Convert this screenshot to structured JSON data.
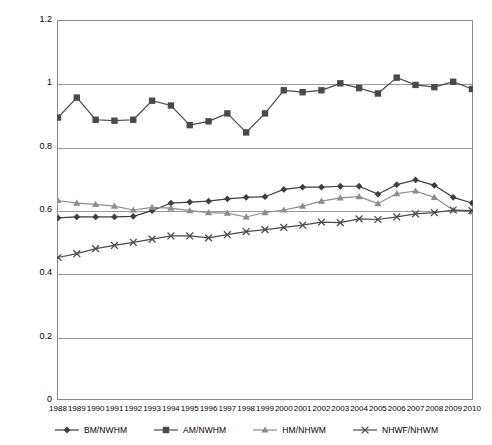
{
  "chart_data": {
    "type": "line",
    "title": "",
    "xlabel": "",
    "ylabel": "",
    "ylim": [
      0,
      1.2
    ],
    "yticks": [
      "0",
      "0.2",
      "0.4",
      "0.6",
      "0.8",
      "1",
      "1.2"
    ],
    "ytick_values": [
      0,
      0.2,
      0.4,
      0.6,
      0.8,
      1.0,
      1.2
    ],
    "grid": true,
    "legend_position": "bottom",
    "categories": [
      "1988",
      "1989",
      "1990",
      "1991",
      "1992",
      "1993",
      "1994",
      "1995",
      "1996",
      "1997",
      "1998",
      "1999",
      "2000",
      "2001",
      "2002",
      "2003",
      "2004",
      "2005",
      "2006",
      "2007",
      "2008",
      "2009",
      "2010"
    ],
    "series": [
      {
        "name": "BM/NWHM",
        "marker": "diamond",
        "color": "#3f3f3f",
        "values": [
          0.575,
          0.578,
          0.578,
          0.578,
          0.58,
          0.598,
          0.622,
          0.625,
          0.628,
          0.635,
          0.64,
          0.642,
          0.665,
          0.672,
          0.672,
          0.675,
          0.675,
          0.65,
          0.68,
          0.695,
          0.678,
          0.64,
          0.622
        ]
      },
      {
        "name": "AM/NWHM",
        "marker": "square",
        "color": "#4a4a4a",
        "values": [
          0.892,
          0.955,
          0.885,
          0.882,
          0.885,
          0.945,
          0.93,
          0.868,
          0.88,
          0.905,
          0.845,
          0.905,
          0.978,
          0.972,
          0.978,
          1.0,
          0.985,
          0.968,
          1.018,
          0.995,
          0.988,
          1.005,
          0.982
        ]
      },
      {
        "name": "HM/NHWM",
        "marker": "triangle",
        "color": "#8c8c8c",
        "values": [
          0.63,
          0.622,
          0.618,
          0.612,
          0.6,
          0.608,
          0.606,
          0.598,
          0.592,
          0.59,
          0.578,
          0.592,
          0.6,
          0.612,
          0.628,
          0.638,
          0.642,
          0.62,
          0.652,
          0.66,
          0.64,
          0.6,
          0.595
        ]
      },
      {
        "name": "NHWF/NHWM",
        "marker": "x",
        "color": "#4a4a4a",
        "values": [
          0.45,
          0.462,
          0.478,
          0.488,
          0.498,
          0.508,
          0.518,
          0.518,
          0.512,
          0.522,
          0.532,
          0.538,
          0.545,
          0.552,
          0.562,
          0.56,
          0.572,
          0.57,
          0.578,
          0.588,
          0.592,
          0.6,
          0.598
        ]
      }
    ]
  },
  "legend": {
    "items": [
      {
        "label": "BM/NWHM"
      },
      {
        "label": "AM/NWHM"
      },
      {
        "label": "HM/NHWM"
      },
      {
        "label": "NHWF/NHWM"
      }
    ]
  }
}
